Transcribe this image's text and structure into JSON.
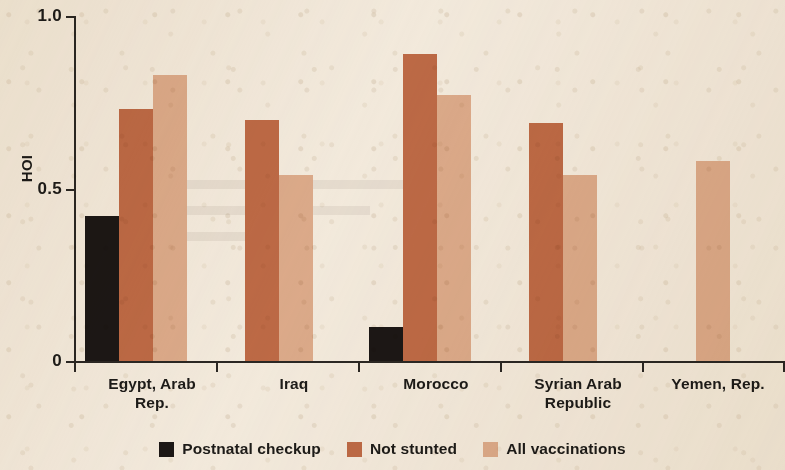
{
  "chart_data": {
    "type": "bar",
    "title": "",
    "xlabel": "",
    "ylabel": "HOI",
    "ylim": [
      0,
      1.0
    ],
    "ytick_values": [
      0,
      0.5,
      1.0
    ],
    "ytick_labels": [
      "0",
      "0.5",
      "1.0"
    ],
    "grid": false,
    "legend_position": "bottom-center",
    "categories": [
      "Egypt, Arab Rep.",
      "Iraq",
      "Morocco",
      "Syrian Arab Republic",
      "Yemen, Rep."
    ],
    "category_label_lines": [
      [
        "Egypt, Arab",
        "Rep."
      ],
      [
        "Iraq"
      ],
      [
        "Morocco"
      ],
      [
        "Syrian Arab",
        "Republic"
      ],
      [
        "Yemen, Rep."
      ]
    ],
    "series": [
      {
        "name": "Postnatal checkup",
        "color": "#1c1715",
        "values": [
          0.42,
          null,
          0.1,
          null,
          null
        ]
      },
      {
        "name": "Not stunted",
        "color": "#bd6a46",
        "values": [
          0.73,
          0.7,
          0.89,
          0.69,
          null
        ]
      },
      {
        "name": "All vaccinations",
        "color": "#dcab8b",
        "values": [
          0.83,
          0.54,
          0.77,
          0.54,
          0.58
        ]
      }
    ]
  },
  "legend": {
    "items": [
      {
        "label": "Postnatal checkup",
        "color": "#1c1715",
        "swatch": "legend-swatch-postnatal"
      },
      {
        "label": "Not stunted",
        "color": "#bd6a46",
        "swatch": "legend-swatch-not-stunted"
      },
      {
        "label": "All vaccinations",
        "color": "#dcab8b",
        "swatch": "legend-swatch-all-vaccinations"
      }
    ]
  },
  "axis": {
    "y_title": "HOI",
    "y_labels": {
      "top": "1.0",
      "mid": "0.5",
      "bottom": "0"
    }
  },
  "colors": {
    "background": "#f3ebdf",
    "axis": "#2b2723",
    "text": "#1d1b18",
    "postnatal": "#1c1715",
    "not_stunted": "#bd6a46",
    "all_vaccinations": "#dcab8b"
  }
}
